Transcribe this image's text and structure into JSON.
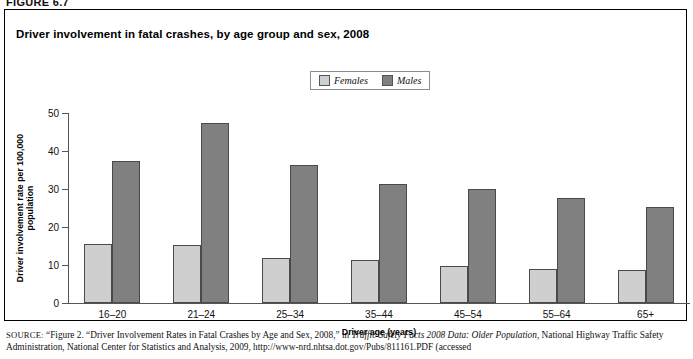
{
  "figure_label": "FIGURE 6.7",
  "chart": {
    "title": "Driver involvement in fatal crashes, by age group and sex, 2008",
    "legend": [
      {
        "label": "Females",
        "color": "#cfcfcf"
      },
      {
        "label": "Males",
        "color": "#808080"
      }
    ]
  },
  "chart_data": {
    "type": "bar",
    "title": "Driver involvement in fatal crashes, by age group and sex, 2008",
    "xlabel": "Driver age (years)",
    "ylabel": "Driver involvement rate per 100,000 population",
    "categories": [
      "16–20",
      "21–24",
      "25–34",
      "35–44",
      "45–54",
      "55–64",
      "65+"
    ],
    "series": [
      {
        "name": "Females",
        "color": "#cfcfcf",
        "values": [
          15.5,
          15.2,
          11.8,
          11.2,
          9.8,
          9.0,
          8.8
        ]
      },
      {
        "name": "Males",
        "color": "#808080",
        "values": [
          37.4,
          47.4,
          36.3,
          31.4,
          30.0,
          27.6,
          25.2
        ]
      }
    ],
    "ylim": [
      0,
      50
    ],
    "yticks": [
      0,
      10,
      20,
      30,
      40,
      50
    ],
    "grid": false,
    "legend_position": "top-center"
  },
  "source": {
    "keyword": "SOURCE:",
    "line1_a": " “Figure 2. “Driver Involvement Rates in Fatal Crashes by Age and Sex, 2008,” in ",
    "line1_italic": "Traffic Safety Facts 2008 Data: Older Population",
    "line1_b": ", National",
    "line2": "Highway Traffic Safety Administration, National Center for Statistics and Analysis, 2009, http://www-nrd.nhtsa.dot.gov/Pubs/811161.PDF (accessed"
  }
}
